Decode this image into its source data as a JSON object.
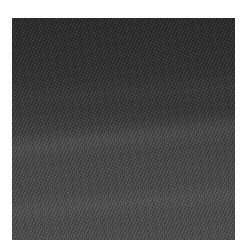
{
  "image": {
    "description": "Grayscale fine-grained woven/fabric texture, darker at top fading lighter toward bottom",
    "colors": {
      "top": "#2a2a2a",
      "middle": "#454545",
      "bottom": "#505050",
      "background": "#ffffff"
    }
  }
}
